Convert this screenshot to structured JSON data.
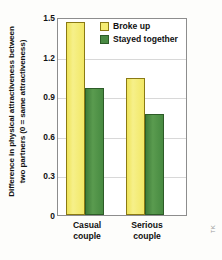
{
  "chart_data": {
    "type": "bar",
    "title": "",
    "xlabel": "",
    "ylabel_line1": "Difference in physical attractiveness between",
    "ylabel_line2": "two partners (0 = same attractiveness)",
    "categories": [
      "Casual couple",
      "Serious couple"
    ],
    "category_labels": [
      {
        "line1": "Casual",
        "line2": "couple"
      },
      {
        "line1": "Serious",
        "line2": "couple"
      }
    ],
    "series": [
      {
        "name": "Broke up",
        "values": [
          1.48,
          1.05
        ],
        "color": "#f2e866"
      },
      {
        "name": "Stayed together",
        "values": [
          0.97,
          0.77
        ],
        "color": "#4a8a44"
      }
    ],
    "ylim": [
      0,
      1.5
    ],
    "yticks": [
      "0",
      "0.3",
      "0.6",
      "0.9",
      "1.2",
      "1.5"
    ],
    "ytick_values": [
      0,
      0.3,
      0.6,
      0.9,
      1.2,
      1.5
    ],
    "grid": true,
    "legend_position": "top-right"
  },
  "legend": {
    "items": [
      {
        "label": "Broke up",
        "swatch": "yellow-swatch"
      },
      {
        "label": "Stayed together",
        "swatch": "green-swatch"
      }
    ]
  },
  "credit": "TK"
}
